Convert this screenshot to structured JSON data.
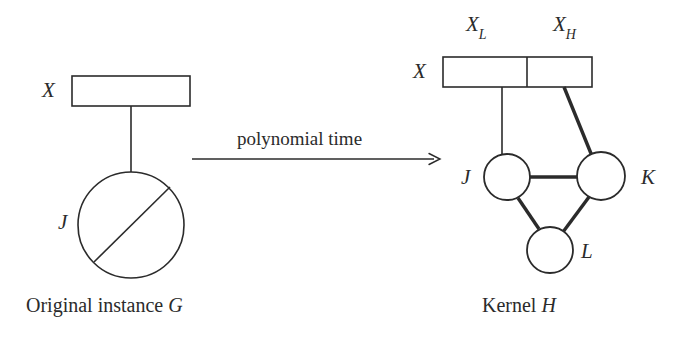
{
  "figure": {
    "background_color": "#ffffff",
    "ink_color": "#2b2b2b"
  },
  "left_panel": {
    "name": "original-instance",
    "box_label": "X",
    "circle_label": "J",
    "caption_text": "Original instance",
    "caption_symbol": "G"
  },
  "arrow": {
    "label": "polynomial time",
    "direction": "right"
  },
  "right_panel": {
    "name": "kernel-instance",
    "box_label": "X",
    "segment_labels": [
      {
        "base": "X",
        "sub": "L"
      },
      {
        "base": "X",
        "sub": "H"
      }
    ],
    "vertex_labels": [
      {
        "id": "J",
        "text": "J"
      },
      {
        "id": "K",
        "text": "K"
      },
      {
        "id": "L",
        "text": "L"
      }
    ],
    "caption_text": "Kernel",
    "caption_symbol": "H"
  },
  "geometry": {
    "left_box": {
      "x": 72,
      "y": 76,
      "w": 118,
      "h": 30
    },
    "left_stem": {
      "x1": 131,
      "y1": 106,
      "x2": 131,
      "y2": 173
    },
    "left_circle": {
      "cx": 131,
      "cy": 225,
      "r": 53
    },
    "left_chord": {
      "x1": 94,
      "y1": 262,
      "x2": 169,
      "y2": 188
    },
    "arrow_line": {
      "x1": 192,
      "y1": 159,
      "x2": 440,
      "y2": 159
    },
    "right_box": {
      "x": 443,
      "y": 57,
      "w": 149,
      "h": 30
    },
    "right_box_divider_x": 527,
    "edge_thin": {
      "x1": 502,
      "y1": 87,
      "x2": 502,
      "y2": 154
    },
    "edge_thick_xh_k": {
      "x1": 563,
      "y1": 87,
      "x2": 597,
      "y2": 154
    },
    "node_j": {
      "cx": 507,
      "cy": 177,
      "r": 23
    },
    "node_k": {
      "cx": 601,
      "cy": 176,
      "r": 24
    },
    "node_l": {
      "cx": 550,
      "cy": 250,
      "r": 23
    }
  }
}
